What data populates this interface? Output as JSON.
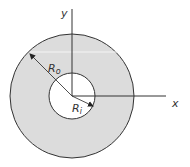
{
  "diagram": {
    "type": "annulus-cross-section",
    "colors": {
      "background": "#ffffff",
      "ring_fill": "#dcdcdc",
      "hole_fill": "#ffffff",
      "stroke": "#333333",
      "highlight_line": "#f2f2f2"
    },
    "center": [
      72,
      96
    ],
    "outer_radius": 62,
    "inner_radius": 23,
    "labels": {
      "y_axis": "y",
      "x_axis": "x",
      "outer_radius": "R",
      "outer_radius_sub": "o",
      "inner_radius": "R",
      "inner_radius_sub": "i"
    }
  }
}
